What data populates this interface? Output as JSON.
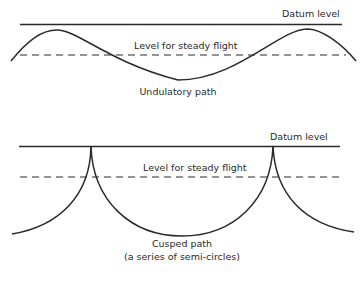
{
  "diagram": {
    "colors": {
      "ink": "#2a2a2a",
      "background": "#ffffff"
    },
    "panels": [
      {
        "id": "undulatory",
        "datum_label": "Datum level",
        "steady_label": "Level for steady flight",
        "caption_line1": "Undulatory path"
      },
      {
        "id": "cusped",
        "datum_label": "Datum level",
        "steady_label": "Level for steady flight",
        "caption_line1": "Cusped path",
        "caption_line2": "(a series of semi-circles)"
      }
    ]
  }
}
